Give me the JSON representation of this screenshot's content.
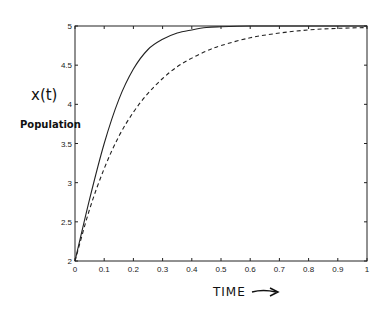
{
  "chart_data": {
    "type": "line",
    "title": "",
    "xlabel": "TIME",
    "xlabel_arrow": "→",
    "ylabel": "x(t)",
    "ylabel_sub": "Population",
    "xlim": [
      0,
      1
    ],
    "ylim": [
      2,
      5
    ],
    "grid": false,
    "legend": null,
    "x_ticks": [
      "0",
      "0.1",
      "0.2",
      "0.3",
      "0.4",
      "0.5",
      "0.6",
      "0.7",
      "0.8",
      "0.9",
      "1"
    ],
    "y_ticks": [
      "2",
      "2.5",
      "3",
      "3.5",
      "4",
      "4.5",
      "5"
    ],
    "x": [
      0,
      0.05,
      0.1,
      0.15,
      0.2,
      0.25,
      0.3,
      0.35,
      0.4,
      0.45,
      0.5,
      0.6,
      0.7,
      0.8,
      0.9,
      1.0
    ],
    "series": [
      {
        "name": "solid",
        "style": "solid",
        "values": [
          2.0,
          2.79,
          3.5,
          4.06,
          4.45,
          4.7,
          4.83,
          4.91,
          4.95,
          4.98,
          4.99,
          5.0,
          5.0,
          5.0,
          5.0,
          5.0
        ]
      },
      {
        "name": "dashed",
        "style": "dashed",
        "values": [
          2.0,
          2.66,
          3.18,
          3.59,
          3.9,
          4.14,
          4.33,
          4.48,
          4.59,
          4.68,
          4.75,
          4.85,
          4.91,
          4.95,
          4.97,
          4.98
        ]
      }
    ]
  }
}
